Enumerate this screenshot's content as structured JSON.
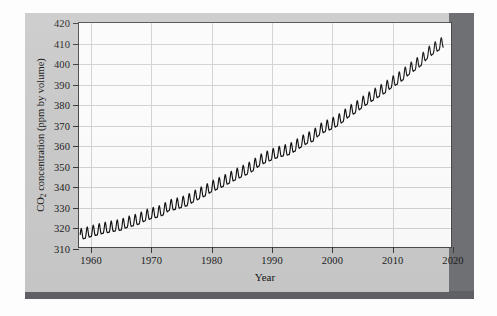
{
  "figure": {
    "panel_bg": "#c9c9c9",
    "plot_bg": "#fbfbfb",
    "frame_color": "#4a4a4a",
    "grid_color": "#d2d2d2",
    "line_color": "#111111"
  },
  "chart_data": {
    "type": "line",
    "title": "",
    "subtitle": "",
    "xlabel": "Year",
    "ylabel": "CO2 concentration (ppm by volume)",
    "ylabel_parts": {
      "pre": "CO",
      "sub": "2",
      "post": " concentration (ppm by volume)"
    },
    "xlim": [
      1958,
      2020
    ],
    "ylim": [
      310,
      420
    ],
    "xticks": [
      1960,
      1970,
      1980,
      1990,
      2000,
      2010,
      2020
    ],
    "xticklabels": [
      "1960",
      "1970",
      "1980",
      "1990",
      "2000",
      "2010",
      "2020"
    ],
    "yticks": [
      310,
      320,
      330,
      340,
      350,
      360,
      370,
      380,
      390,
      400,
      410,
      420
    ],
    "yticklabels": [
      "310",
      "320",
      "330",
      "340",
      "350",
      "360",
      "370",
      "380",
      "390",
      "400",
      "410",
      "420"
    ],
    "grid": true,
    "grid_axes": "both",
    "legend": false,
    "legend_position": "none",
    "annotations": [],
    "seasonal_amplitude_ppm": 3.2,
    "series": [
      {
        "name": "Mauna Loa monthly mean CO2",
        "x_start": 1958.2,
        "x_step_months": 1,
        "annual_mean": {
          "years": [
            1958,
            1959,
            1960,
            1961,
            1962,
            1963,
            1964,
            1965,
            1966,
            1967,
            1968,
            1969,
            1970,
            1971,
            1972,
            1973,
            1974,
            1975,
            1976,
            1977,
            1978,
            1979,
            1980,
            1981,
            1982,
            1983,
            1984,
            1985,
            1986,
            1987,
            1988,
            1989,
            1990,
            1991,
            1992,
            1993,
            1994,
            1995,
            1996,
            1997,
            1998,
            1999,
            2000,
            2001,
            2002,
            2003,
            2004,
            2005,
            2006,
            2007,
            2008,
            2009,
            2010,
            2011,
            2012,
            2013,
            2014,
            2015,
            2016,
            2017,
            2018
          ],
          "values": [
            315.3,
            315.98,
            316.91,
            317.64,
            318.45,
            318.99,
            319.62,
            320.04,
            321.38,
            322.16,
            323.04,
            324.62,
            325.68,
            326.32,
            327.45,
            329.68,
            330.18,
            331.11,
            332.04,
            333.83,
            335.4,
            336.84,
            338.75,
            340.11,
            341.45,
            343.05,
            344.65,
            346.12,
            347.42,
            349.19,
            351.57,
            353.12,
            354.39,
            355.61,
            356.45,
            357.1,
            358.83,
            360.82,
            362.61,
            363.73,
            366.7,
            368.38,
            369.55,
            371.14,
            373.28,
            375.8,
            377.52,
            379.8,
            381.9,
            383.79,
            385.6,
            387.43,
            389.9,
            391.65,
            393.85,
            396.52,
            398.65,
            400.83,
            404.24,
            406.55,
            408.52
          ]
        }
      }
    ]
  }
}
